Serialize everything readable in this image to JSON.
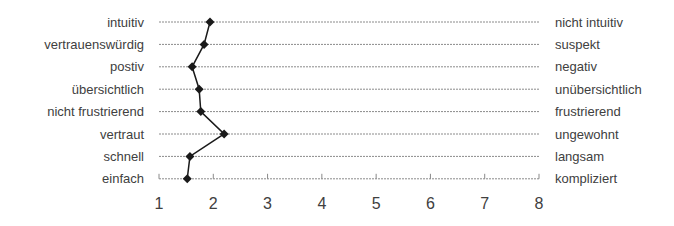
{
  "chart_data": {
    "type": "line",
    "orientation": "horizontal-profile",
    "title": "",
    "xlabel": "",
    "ylabel": "",
    "xlim": [
      1,
      8
    ],
    "x_ticks": [
      "1",
      "2",
      "3",
      "4",
      "5",
      "6",
      "7",
      "8"
    ],
    "grid": true,
    "legend": null,
    "left_labels": [
      "intuitiv",
      "vertrauenswürdig",
      "postiv",
      "übersichtlich",
      "nicht frustrierend",
      "vertraut",
      "schnell",
      "einfach"
    ],
    "right_labels": [
      "nicht intuitiv",
      "suspekt",
      "negativ",
      "unübersichtlich",
      "frustrierend",
      "ungewohnt",
      "langsam",
      "kompliziert"
    ],
    "series": [
      {
        "name": "Bewertung",
        "values": [
          1.94,
          1.83,
          1.61,
          1.74,
          1.77,
          2.2,
          1.57,
          1.52
        ]
      }
    ],
    "colors": {
      "line": "#1a1a1a",
      "grid": "#8a8a8a",
      "text": "#404040"
    }
  }
}
